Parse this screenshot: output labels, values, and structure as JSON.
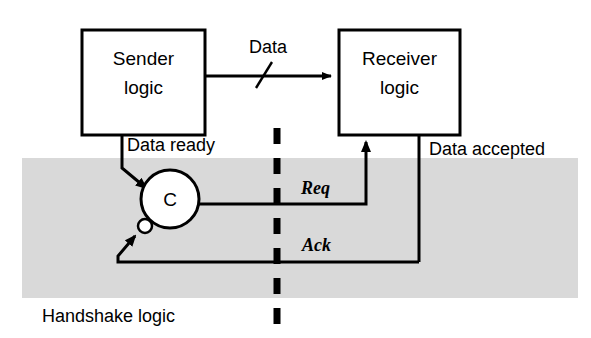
{
  "diagram": {
    "colors": {
      "line": "#000000",
      "box_fill": "#ffffff",
      "region_fill": "#d9d9d9",
      "text": "#000000"
    },
    "blocks": [
      {
        "id": "sender",
        "label_line1": "Sender",
        "label_line2": "logic"
      },
      {
        "id": "receiver",
        "label_line1": "Receiver",
        "label_line2": "logic"
      }
    ],
    "gate": {
      "id": "c-element",
      "label": "C",
      "inverting_input": true
    },
    "signals": {
      "data": "Data",
      "data_ready": "Data ready",
      "data_accepted": "Data accepted",
      "req": "Req",
      "ack": "Ack"
    },
    "region": {
      "label": "Handshake logic"
    }
  }
}
